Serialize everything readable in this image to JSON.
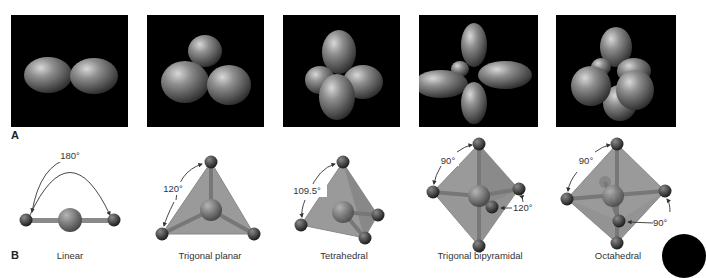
{
  "figure": {
    "panel_a_label": "A",
    "panel_b_label": "B",
    "orbital_panels": [
      {
        "geometry": "linear",
        "lobes": 2
      },
      {
        "geometry": "trigonal-planar",
        "lobes": 3
      },
      {
        "geometry": "tetrahedral",
        "lobes": 4
      },
      {
        "geometry": "trigonal-bipyramidal",
        "lobes": 5
      },
      {
        "geometry": "octahedral",
        "lobes": 6
      }
    ],
    "geometries": [
      {
        "name": "Linear",
        "angles": [
          "180°"
        ]
      },
      {
        "name": "Trigonal planar",
        "angles": [
          "120°"
        ]
      },
      {
        "name": "Tetrahedral",
        "angles": [
          "109.5°"
        ]
      },
      {
        "name": "Trigonal bipyramidal",
        "angles": [
          "90°",
          "120°"
        ]
      },
      {
        "name": "Octahedral",
        "angles": [
          "90°",
          "90°"
        ]
      }
    ],
    "colors": {
      "panel_bg": "#000000",
      "lobe": "#8a8a8a",
      "polyhedron_fill": "#9a9a9a",
      "atom": "#3a3a3a",
      "center_atom": "#6e6e6e"
    }
  }
}
